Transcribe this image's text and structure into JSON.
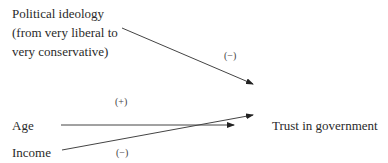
{
  "nodes": {
    "ideology": [
      "Political ideology",
      "(from very liberal to",
      "very conservative)"
    ],
    "age": "Age",
    "income": "Income",
    "outcome": "Trust in government"
  },
  "edges": [
    {
      "from": "ideology",
      "to": "outcome",
      "sign": "(−)"
    },
    {
      "from": "age",
      "to": "outcome",
      "sign": "(+)"
    },
    {
      "from": "income",
      "to": "outcome",
      "sign": "(−)"
    }
  ]
}
